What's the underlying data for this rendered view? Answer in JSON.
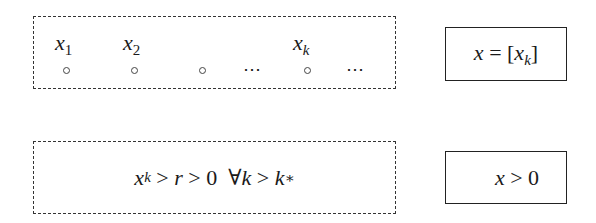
{
  "sequence_box": {
    "labels": [
      {
        "var": "x",
        "sub": "1"
      },
      {
        "var": "x",
        "sub": "2"
      },
      {
        "var": "x",
        "sub": "k"
      }
    ],
    "ellipsis": "⋯"
  },
  "limit_box": {
    "lhs": "x",
    "eq": " = [",
    "inner_var": "x",
    "inner_sub": "k",
    "close": "]"
  },
  "condition_box": {
    "x": "x",
    "x_sub": "k",
    "gt1": " > ",
    "r": "r",
    "gt2": " > 0  ∀",
    "k": "k",
    "gt3": " > ",
    "kstar": "k",
    "kstar_sub": "∗"
  },
  "result_box": {
    "var": "x",
    "rest": " > 0"
  }
}
